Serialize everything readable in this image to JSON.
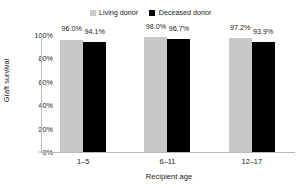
{
  "chart_data": {
    "type": "bar",
    "title": "",
    "xlabel": "Recipient age",
    "ylabel": "Graft survival",
    "categories": [
      "1–5",
      "6–11",
      "12–17"
    ],
    "series": [
      {
        "name": "Living donor",
        "color": "#c8c8c8",
        "values": [
          96.0,
          94.1,
          98.0
        ],
        "labels": [
          "96.0%",
          "98.0%",
          "97.2%"
        ],
        "value_list": [
          96.0,
          98.0,
          97.2
        ]
      },
      {
        "name": "Deceased donor",
        "color": "#000000",
        "values": [
          94.1,
          96.7,
          93.9
        ],
        "labels": [
          "94.1%",
          "96.7%",
          "93.9%"
        ],
        "value_list": [
          94.1,
          96.7,
          93.9
        ]
      }
    ],
    "ylim": [
      0,
      100
    ],
    "yticks": [
      0,
      20,
      40,
      60,
      80,
      100
    ],
    "ytick_labels": [
      "0%",
      "20%",
      "40%",
      "60%",
      "80%",
      "100%"
    ],
    "grid": false,
    "legend_position": "top-center"
  },
  "legend": {
    "entries": [
      {
        "label": "Living donor",
        "swatch": "legend-swatch-living",
        "color": "#c8c8c8"
      },
      {
        "label": "Deceased donor",
        "swatch": "legend-swatch-deceased",
        "color": "#000000"
      }
    ]
  },
  "axes": {
    "y_title": "Graft survival",
    "x_title": "Recipient age"
  },
  "groups": [
    {
      "category": "1–5",
      "bars": [
        {
          "series": "Living donor",
          "value": 96.0,
          "label": "96.0%"
        },
        {
          "series": "Deceased donor",
          "value": 94.1,
          "label": "94.1%"
        }
      ]
    },
    {
      "category": "6–11",
      "bars": [
        {
          "series": "Living donor",
          "value": 98.0,
          "label": "98.0%"
        },
        {
          "series": "Deceased donor",
          "value": 96.7,
          "label": "96.7%"
        }
      ]
    },
    {
      "category": "12–17",
      "bars": [
        {
          "series": "Living donor",
          "value": 97.2,
          "label": "97.2%"
        },
        {
          "series": "Deceased donor",
          "value": 93.9,
          "label": "93.9%"
        }
      ]
    }
  ],
  "yticks": [
    {
      "label": "100%",
      "value": 100
    },
    {
      "label": "80%",
      "value": 80
    },
    {
      "label": "60%",
      "value": 60
    },
    {
      "label": "40%",
      "value": 40
    },
    {
      "label": "20%",
      "value": 20
    },
    {
      "label": "0%",
      "value": 0
    }
  ]
}
